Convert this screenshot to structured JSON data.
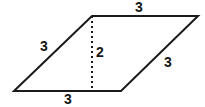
{
  "figure": {
    "name": "parallelogram-with-height",
    "background_color": "#ffffff",
    "stroke_color": "#1a1a1a",
    "label_color": "#151515",
    "stroke_width": 2,
    "vertices": {
      "bottom_left": [
        14,
        91
      ],
      "top_left": [
        92,
        16
      ],
      "top_right": [
        198,
        16
      ],
      "bottom_right": [
        121,
        91
      ]
    },
    "height_segment": {
      "from": [
        92,
        16
      ],
      "to": [
        92,
        91
      ],
      "style": "dotted"
    },
    "labels": {
      "top_side": "3",
      "left_side": "3",
      "right_side": "3",
      "bottom_side": "3",
      "height": "2"
    },
    "label_positions": {
      "top_side": [
        139,
        7
      ],
      "left_side": [
        44,
        46
      ],
      "right_side": [
        168,
        62
      ],
      "bottom_side": [
        68,
        99
      ],
      "height": [
        100,
        52
      ]
    }
  }
}
